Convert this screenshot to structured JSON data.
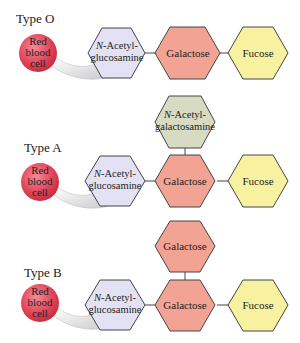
{
  "colors": {
    "cell": "#e0475a",
    "glcnac": "#e3e2f4",
    "galactose": "#f2a394",
    "fucose": "#f8f2a0",
    "galnac": "#d6dbc2",
    "stroke": "#444444"
  },
  "groups": [
    {
      "type_label": "Type O",
      "cell_label": [
        "Red",
        "blood",
        "cell"
      ],
      "chain": [
        "N-Acetyl-glucosamine",
        "Galactose",
        "Fucose"
      ],
      "branch": null
    },
    {
      "type_label": "Type A",
      "cell_label": [
        "Red",
        "blood",
        "cell"
      ],
      "chain": [
        "N-Acetyl-glucosamine",
        "Galactose",
        "Fucose"
      ],
      "branch": "N-Acetyl-galactosamine"
    },
    {
      "type_label": "Type B",
      "cell_label": [
        "Red",
        "blood",
        "cell"
      ],
      "chain": [
        "N-Acetyl-glucosamine",
        "Galactose",
        "Fucose"
      ],
      "branch": "Galactose"
    }
  ],
  "text": {
    "typeO": "Type O",
    "typeA": "Type A",
    "typeB": "Type B",
    "red": "Red",
    "blood": "blood",
    "cell": "cell",
    "nacetyl": "-Acetyl-",
    "n": "N",
    "glucosamine": "glucosamine",
    "galactosamine": "galactosamine",
    "galactose": "Galactose",
    "fucose": "Fucose"
  }
}
